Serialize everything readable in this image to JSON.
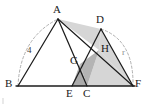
{
  "figure": {
    "kind": "geometry-diagram",
    "background": "#ffffff",
    "stroke_color": "#1c1c1c",
    "dash_color": "#a0a0a0",
    "fill_light": "#d4d4d4",
    "fill_dark": "#a9a9a9",
    "width": 148,
    "height": 104
  },
  "points": {
    "A": {
      "label": "A",
      "x": 58,
      "y": 19,
      "label_x": 53,
      "label_y": 5
    },
    "B": {
      "label": "B",
      "x": 18,
      "y": 86,
      "label_x": 6,
      "label_y": 80
    },
    "C": {
      "label": "C",
      "x": 87,
      "y": 86,
      "label_x": 84,
      "label_y": 88
    },
    "D": {
      "label": "D",
      "x": 101,
      "y": 29,
      "label_x": 97,
      "label_y": 15
    },
    "E": {
      "label": "E",
      "x": 72,
      "y": 86,
      "label_x": 67,
      "label_y": 88
    },
    "F": {
      "label": "F",
      "x": 133,
      "y": 86,
      "label_x": 135,
      "label_y": 80
    },
    "G": {
      "label": "G",
      "x": 80,
      "y": 64,
      "label_x": 71,
      "label_y": 56
    },
    "H": {
      "label": "H",
      "x": 99,
      "y": 50,
      "label_x": 102,
      "label_y": 44
    }
  },
  "segments": [
    {
      "name": "base-line-BF",
      "from": "B",
      "to": "F"
    },
    {
      "name": "side-AB",
      "from": "A",
      "to": "B"
    },
    {
      "name": "side-AC",
      "from": "A",
      "to": "C"
    },
    {
      "name": "cevian-AF",
      "from": "A",
      "to": "F"
    },
    {
      "name": "side-DE",
      "from": "D",
      "to": "E"
    },
    {
      "name": "side-DF",
      "from": "D",
      "to": "F"
    }
  ],
  "arcs": [
    {
      "name": "arc-BA",
      "from": "B",
      "to": "A",
      "style": "dashed",
      "label": "4"
    },
    {
      "name": "arc-DF",
      "from": "D",
      "to": "F",
      "style": "dashed",
      "label": "r"
    }
  ],
  "measure_labels": {
    "left_arc": "4",
    "right_arc": "r"
  },
  "shaded_regions": [
    {
      "name": "region-A-H-D",
      "tone": "light",
      "vertices": [
        "A",
        "H",
        "D"
      ]
    },
    {
      "name": "region-D-H-F",
      "tone": "light",
      "vertices": [
        "D",
        "H",
        "F"
      ]
    },
    {
      "name": "region-H-C-F",
      "tone": "light",
      "vertices": [
        "H",
        "C",
        "F"
      ]
    },
    {
      "name": "region-E-C-G",
      "tone": "dark",
      "vertices": [
        "E",
        "C",
        "G"
      ]
    },
    {
      "name": "region-G-C-H",
      "tone": "dark",
      "vertices": [
        "G",
        "C",
        "H"
      ]
    }
  ]
}
